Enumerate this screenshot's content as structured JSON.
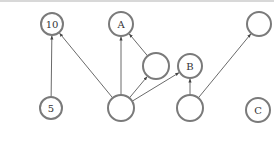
{
  "diagram": {
    "type": "directed-graph",
    "colors": {
      "node_stroke": "#7a7a7a",
      "edge": "#444444",
      "label": "#333333"
    },
    "nodes": [
      {
        "id": "n10",
        "label": "10",
        "x": 52,
        "y": 24,
        "r": 11
      },
      {
        "id": "nA",
        "label": "A",
        "x": 121,
        "y": 24,
        "r": 12
      },
      {
        "id": "nTR",
        "label": "",
        "x": 259,
        "y": 24,
        "r": 12
      },
      {
        "id": "nMid",
        "label": "",
        "x": 156,
        "y": 66,
        "r": 13
      },
      {
        "id": "nB",
        "label": "B",
        "x": 190,
        "y": 66,
        "r": 12
      },
      {
        "id": "n5",
        "label": "5",
        "x": 51,
        "y": 108,
        "r": 11
      },
      {
        "id": "nHub",
        "label": "",
        "x": 121,
        "y": 108,
        "r": 13
      },
      {
        "id": "nBR",
        "label": "",
        "x": 190,
        "y": 108,
        "r": 13
      },
      {
        "id": "nC",
        "label": "C",
        "x": 258,
        "y": 110,
        "r": 12
      }
    ],
    "edges": [
      {
        "from": "n5",
        "to": "n10"
      },
      {
        "from": "nHub",
        "to": "n10"
      },
      {
        "from": "nHub",
        "to": "nA"
      },
      {
        "from": "nMid",
        "to": "nA"
      },
      {
        "from": "nHub",
        "to": "nMid"
      },
      {
        "from": "nHub",
        "to": "nB"
      },
      {
        "from": "nBR",
        "to": "nB"
      },
      {
        "from": "nBR",
        "to": "nTR"
      }
    ]
  }
}
